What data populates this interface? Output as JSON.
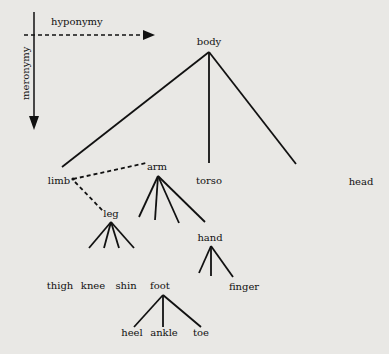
{
  "axes": {
    "horizontal": {
      "label": "hyponymy",
      "style": "dashed-arrow"
    },
    "vertical": {
      "label": "meronymy",
      "style": "solid-arrow"
    }
  },
  "nodes": {
    "body": "body",
    "limb": "limb",
    "arm": "arm",
    "torso": "torso",
    "head": "head",
    "leg": "leg",
    "hand": "hand",
    "thigh": "thigh",
    "knee": "knee",
    "shin": "shin",
    "foot": "foot",
    "finger": "finger",
    "heel": "heel",
    "ankle": "ankle",
    "toe": "toe"
  },
  "edges": {
    "meronymy": [
      [
        "body",
        "limb"
      ],
      [
        "body",
        "torso"
      ],
      [
        "body",
        "head"
      ],
      [
        "leg",
        "thigh"
      ],
      [
        "leg",
        "knee"
      ],
      [
        "leg",
        "shin"
      ],
      [
        "leg",
        "foot"
      ],
      [
        "hand",
        "finger"
      ],
      [
        "foot",
        "heel"
      ],
      [
        "foot",
        "ankle"
      ],
      [
        "foot",
        "toe"
      ],
      [
        "arm",
        "hand"
      ]
    ],
    "hyponymy": [
      [
        "limb",
        "arm"
      ],
      [
        "limb",
        "leg"
      ]
    ]
  },
  "colors": {
    "background": "#e9e8e5",
    "ink": "#111111"
  }
}
